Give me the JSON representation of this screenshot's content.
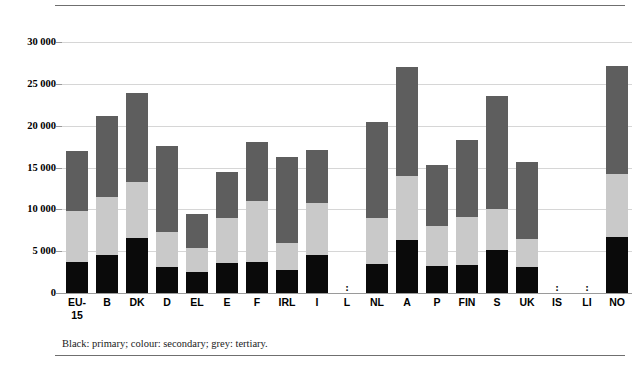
{
  "caption": "Black: primary; colour: secondary; grey: tertiary.",
  "axis": {
    "y_ticks": [
      "30 000",
      "25 000",
      "20 000",
      "15 000",
      "10 000",
      "5 000",
      "0"
    ]
  },
  "colors": {
    "primary": "#0a0a0a",
    "secondary": "#c9c9c9",
    "tertiary": "#5e5e5e",
    "gridline": "#d6d6d6",
    "rule": "#6f6f6f"
  },
  "no_data_marker": ":",
  "chart_data": {
    "type": "bar",
    "title": "",
    "subtitle": "",
    "xlabel": "",
    "ylabel": "",
    "stacked": true,
    "grid": true,
    "legend_position": "caption-below",
    "ylim": [
      0,
      30000
    ],
    "ytick_values": [
      0,
      5000,
      10000,
      15000,
      20000,
      25000,
      30000
    ],
    "ytick_labels": [
      "0",
      "5 000",
      "10 000",
      "15 000",
      "20 000",
      "25 000",
      "30 000"
    ],
    "categories": [
      "EU-15",
      "B",
      "DK",
      "D",
      "EL",
      "E",
      "F",
      "IRL",
      "I",
      "L",
      "NL",
      "A",
      "P",
      "FIN",
      "S",
      "UK",
      "IS",
      "LI",
      "NO"
    ],
    "category_labels": [
      "EU-\n15",
      "B",
      "DK",
      "D",
      "EL",
      "E",
      "F",
      "IRL",
      "I",
      "L",
      "NL",
      "A",
      "P",
      "FIN",
      "S",
      "UK",
      "IS",
      "LI",
      "NO"
    ],
    "series": [
      {
        "name": "primary",
        "color": "#0a0a0a",
        "values": [
          3700,
          4550,
          6600,
          3100,
          2500,
          3600,
          3700,
          2750,
          4550,
          null,
          3500,
          6350,
          3250,
          3350,
          5150,
          3100,
          null,
          null,
          6700
        ]
      },
      {
        "name": "secondary",
        "color": "#c9c9c9",
        "values": [
          6100,
          6950,
          6700,
          4200,
          2900,
          5400,
          7300,
          3250,
          6200,
          null,
          5500,
          7650,
          4750,
          5750,
          4900,
          3350,
          null,
          null,
          7500
        ]
      },
      {
        "name": "tertiary",
        "color": "#5e5e5e",
        "values": [
          7200,
          9700,
          10600,
          10300,
          4100,
          5500,
          7100,
          10200,
          6350,
          null,
          11400,
          13000,
          7300,
          9200,
          13450,
          9250,
          null,
          null,
          12900
        ]
      }
    ],
    "totals": [
      17000,
      21200,
      23900,
      17600,
      9500,
      14500,
      18100,
      16200,
      17100,
      null,
      20400,
      27000,
      15300,
      18300,
      23500,
      15700,
      null,
      null,
      27100
    ]
  }
}
